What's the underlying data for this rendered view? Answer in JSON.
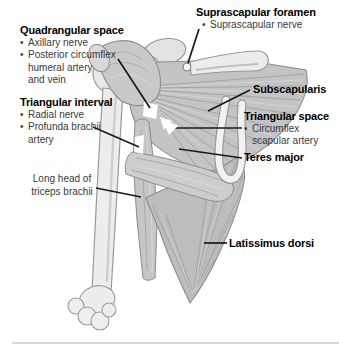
{
  "ui": {
    "bullet_char": "•"
  },
  "labels": {
    "quadrangular_space": {
      "title": "Quadrangular space",
      "bullets": [
        {
          "lines": [
            "Axillary nerve"
          ]
        },
        {
          "lines": [
            "Posterior circumflex",
            "humeral artery",
            "and vein"
          ]
        }
      ]
    },
    "triangular_interval": {
      "title": "Triangular interval",
      "bullets": [
        {
          "lines": [
            "Radial nerve"
          ]
        },
        {
          "lines": [
            "Profunda brachii",
            "artery"
          ]
        }
      ]
    },
    "long_head_triceps": {
      "lines": [
        "Long head of",
        "triceps brachii"
      ]
    },
    "suprascapular_foramen": {
      "title": "Suprascapular foramen",
      "bullets": [
        {
          "lines": [
            "Suprascapular nerve"
          ]
        }
      ]
    },
    "subscapularis": {
      "title": "Subscapularis"
    },
    "triangular_space": {
      "title": "Triangular space",
      "bullets": [
        {
          "lines": [
            "Circumflex",
            "scapular artery"
          ]
        }
      ]
    },
    "teres_major": {
      "title": "Teres major"
    },
    "latissimus_dorsi": {
      "title": "Latissimus dorsi"
    }
  },
  "colors": {
    "background": "#ffffff",
    "title_text": "#000000",
    "bullet_text": "#3a3a3a",
    "leader_line": "#1a1a1a",
    "bone_fill": "#ededed",
    "bone_outline": "#9a9a9a",
    "muscle_fill": "#c4c4c4",
    "muscle_dark_striation": "#a0a0a0",
    "muscle_light_striation": "#d8d8d8",
    "scapula_border_white": "#f2f2f2",
    "divider": "#d6d6d6"
  }
}
